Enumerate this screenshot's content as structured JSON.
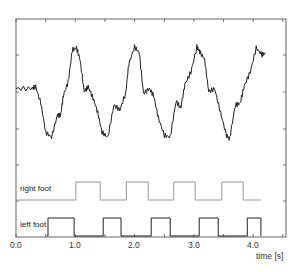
{
  "chart_data": {
    "type": "line",
    "title": "",
    "xlabel": "time [s]",
    "ylabel": "",
    "xlim": [
      0.0,
      4.5
    ],
    "x_ticks": [
      "0.0",
      "1.0",
      "2.0",
      "3.0",
      "4.0"
    ],
    "grid": false,
    "legend": "none",
    "series": [
      {
        "name": "signal",
        "color": "#222222",
        "x": [
          0.0,
          0.25,
          0.33,
          0.42,
          0.5,
          0.6,
          0.7,
          0.75,
          0.8,
          0.88,
          0.95,
          1.02,
          1.08,
          1.15,
          1.22,
          1.3,
          1.38,
          1.45,
          1.55,
          1.65,
          1.75,
          1.85,
          1.9,
          2.0,
          2.08,
          2.15,
          2.25,
          2.32,
          2.4,
          2.5,
          2.6,
          2.7,
          2.78,
          2.85,
          2.95,
          3.05,
          3.1,
          3.18,
          3.25,
          3.35,
          3.45,
          3.55,
          3.6,
          3.7,
          3.78,
          3.85,
          3.95,
          4.05,
          4.15,
          4.2
        ],
        "y": [
          0.55,
          0.55,
          0.57,
          0.4,
          0.1,
          0.05,
          0.28,
          0.27,
          0.48,
          0.62,
          0.95,
          0.97,
          0.85,
          0.52,
          0.57,
          0.45,
          0.3,
          0.1,
          0.05,
          0.38,
          0.33,
          0.5,
          0.8,
          0.98,
          0.92,
          0.5,
          0.55,
          0.48,
          0.25,
          0.07,
          0.05,
          0.42,
          0.35,
          0.6,
          0.72,
          0.98,
          0.93,
          0.85,
          0.52,
          0.55,
          0.3,
          0.07,
          0.03,
          0.38,
          0.4,
          0.58,
          0.72,
          0.97,
          0.9,
          0.92
        ],
        "y_range": [
          0,
          1
        ]
      },
      {
        "name": "right foot",
        "color": "#888888",
        "type": "step",
        "on_intervals": [
          [
            1.01,
            1.42
          ],
          [
            1.86,
            2.23
          ],
          [
            2.66,
            3.02
          ],
          [
            3.47,
            3.83
          ]
        ],
        "x_end": 4.13
      },
      {
        "name": "left foot",
        "color": "#222222",
        "type": "step",
        "on_intervals": [
          [
            0.54,
            0.98
          ],
          [
            1.47,
            1.77
          ],
          [
            2.28,
            2.6
          ],
          [
            3.09,
            3.41
          ],
          [
            3.9,
            4.13
          ]
        ],
        "x_end": 4.13
      }
    ]
  },
  "labels": {
    "right_foot": "right foot",
    "left_foot": "left foot",
    "xlabel": "time [s]",
    "ticks": [
      "0.0",
      "1.0",
      "2.0",
      "3.0",
      "4.0"
    ]
  }
}
